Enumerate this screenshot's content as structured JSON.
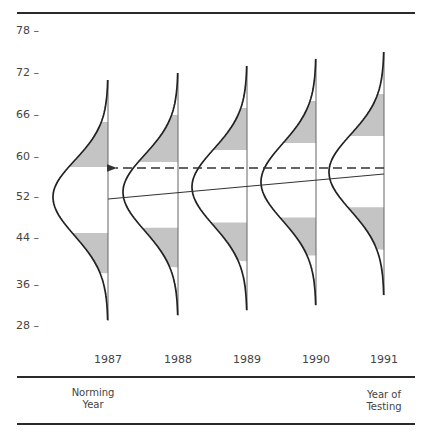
{
  "chart_data": {
    "type": "diagram-distribution",
    "title": "",
    "xlabel": "",
    "ylabel": "",
    "y_ticks": [
      "78",
      "72",
      "66",
      "60",
      "52",
      "44",
      "36",
      "28"
    ],
    "categories": [
      "1987",
      "1988",
      "1989",
      "1990",
      "1991"
    ],
    "distributions": [
      {
        "year": "1987",
        "mean": 52,
        "upper_tail_top": 71,
        "lower_tail_bottom": 29,
        "upper_shade": [
          58,
          65
        ],
        "lower_shade": [
          38,
          45
        ]
      },
      {
        "year": "1988",
        "mean": 53,
        "upper_tail_top": 72,
        "lower_tail_bottom": 30,
        "upper_shade": [
          59,
          66
        ],
        "lower_shade": [
          39,
          46
        ]
      },
      {
        "year": "1989",
        "mean": 54,
        "upper_tail_top": 73,
        "lower_tail_bottom": 31,
        "upper_shade": [
          61,
          67
        ],
        "lower_shade": [
          40,
          47
        ]
      },
      {
        "year": "1990",
        "mean": 55,
        "upper_tail_top": 74,
        "lower_tail_bottom": 32,
        "upper_shade": [
          62,
          68
        ],
        "lower_shade": [
          41,
          48
        ]
      },
      {
        "year": "1991",
        "mean": 57,
        "upper_tail_top": 75,
        "lower_tail_bottom": 34,
        "upper_shade": [
          63,
          69
        ],
        "lower_shade": [
          42,
          50
        ]
      }
    ],
    "solid_trend_line": {
      "from": {
        "year": "1987",
        "value": 52
      },
      "to": {
        "year": "1991",
        "value": 56.5
      }
    },
    "dashed_arrow": {
      "from": {
        "year": "1991",
        "value": 57.5
      },
      "to": {
        "year": "1987",
        "value": 57.5
      }
    },
    "annotations": [
      "Norming Year",
      "Year of Testing"
    ],
    "grid": false
  },
  "labels": {
    "norming": [
      "Norming",
      "Year"
    ],
    "testing": [
      "Year of",
      "Testing"
    ]
  }
}
